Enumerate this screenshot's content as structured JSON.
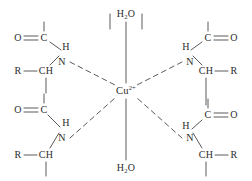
{
  "diagram": {
    "colors": {
      "stroke": "#5a5a5a",
      "text": "#2b2b2b",
      "background": "#ffffff"
    },
    "metal": {
      "element": "Cu",
      "charge": "2+",
      "label": "Cu",
      "x": 126,
      "y": 91
    },
    "axial_ligands": [
      {
        "label": "H",
        "sub": "2",
        "tail": "O",
        "position": "top",
        "x": 126,
        "y": 14
      },
      {
        "label": "H",
        "sub": "2",
        "tail": "O",
        "position": "bottom",
        "x": 126,
        "y": 168
      }
    ],
    "quadrants": [
      {
        "id": "top-left",
        "carbonyl_oxygen": {
          "label": "O",
          "x": 18,
          "y": 38
        },
        "carbonyl_carbon": {
          "label": "C",
          "x": 44,
          "y": 38
        },
        "amide_hydrogen": {
          "label": "H",
          "x": 66,
          "y": 47
        },
        "amide_nitrogen": {
          "label": "N",
          "x": 62,
          "y": 62
        },
        "alpha_r": {
          "label": "R",
          "x": 18,
          "y": 71
        },
        "alpha_carbon": {
          "label": "CH",
          "x": 46,
          "y": 71
        }
      },
      {
        "id": "top-right",
        "carbonyl_oxygen": {
          "label": "O",
          "x": 234,
          "y": 38
        },
        "carbonyl_carbon": {
          "label": "C",
          "x": 208,
          "y": 38
        },
        "amide_hydrogen": {
          "label": "H",
          "x": 186,
          "y": 47
        },
        "amide_nitrogen": {
          "label": "N",
          "x": 190,
          "y": 62
        },
        "alpha_r": {
          "label": "R",
          "x": 234,
          "y": 71
        },
        "alpha_carbon": {
          "label": "CH",
          "x": 206,
          "y": 71
        }
      },
      {
        "id": "bottom-left",
        "carbonyl_oxygen": {
          "label": "O",
          "x": 18,
          "y": 110
        },
        "carbonyl_carbon": {
          "label": "C",
          "x": 44,
          "y": 110
        },
        "amide_hydrogen": {
          "label": "H",
          "x": 66,
          "y": 123
        },
        "amide_nitrogen": {
          "label": "N",
          "x": 62,
          "y": 138
        },
        "alpha_r": {
          "label": "R",
          "x": 18,
          "y": 155
        },
        "alpha_carbon": {
          "label": "CH",
          "x": 46,
          "y": 155
        }
      },
      {
        "id": "bottom-right",
        "carbonyl_oxygen": {
          "label": "O",
          "x": 234,
          "y": 115
        },
        "carbonyl_carbon": {
          "label": "C",
          "x": 208,
          "y": 115
        },
        "amide_hydrogen": {
          "label": "H",
          "x": 186,
          "y": 126
        },
        "amide_nitrogen": {
          "label": "N",
          "x": 190,
          "y": 138
        },
        "alpha_r": {
          "label": "R",
          "x": 234,
          "y": 155
        },
        "alpha_carbon": {
          "label": "CH",
          "x": 206,
          "y": 155
        }
      }
    ]
  }
}
